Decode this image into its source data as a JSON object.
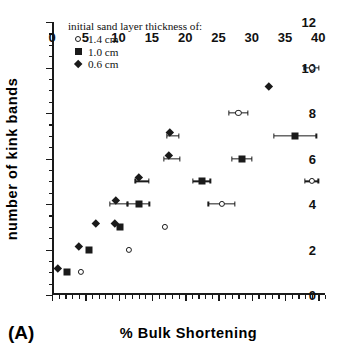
{
  "panel_label": "(A)",
  "legend": {
    "title": "initial sand layer thickness of:",
    "entries": [
      {
        "label": "1.4 cm",
        "marker": "open-circle"
      },
      {
        "label": "1.0 cm",
        "marker": "filled-square"
      },
      {
        "label": "0.6 cm",
        "marker": "filled-diamond"
      }
    ]
  },
  "chart_data": {
    "type": "scatter",
    "title": "",
    "xlabel": "%  Bulk  Shortening",
    "ylabel": "number  of  kink  bands",
    "xlim": [
      0,
      41
    ],
    "ylim": [
      0,
      12
    ],
    "xticks": [
      0,
      5,
      10,
      15,
      20,
      25,
      30,
      35,
      40
    ],
    "yticks": [
      0,
      2,
      4,
      6,
      8,
      10,
      12
    ],
    "xtick_labels": [
      "0",
      "5",
      "10",
      "15",
      "20",
      "25",
      "30",
      "35",
      "40"
    ],
    "ytick_labels": [
      "0",
      "2",
      "4",
      "6",
      "8",
      "10",
      "12"
    ],
    "x_minor_step": 1,
    "y_minor_step": 0.5,
    "grid": false,
    "legend_position": "top-left-inside",
    "series": [
      {
        "name": "1.4 cm",
        "marker": "open-circle",
        "points": [
          {
            "x": 4.3,
            "y": 1,
            "xerr": 0
          },
          {
            "x": 11.5,
            "y": 2,
            "xerr": 0
          },
          {
            "x": 17.0,
            "y": 3,
            "xerr": 0
          },
          {
            "x": 25.5,
            "y": 4,
            "xerr": 2.0
          },
          {
            "x": 39.0,
            "y": 5,
            "xerr": 1.0
          },
          {
            "x": 28.0,
            "y": 8,
            "xerr": 1.4
          },
          {
            "x": 39.0,
            "y": 10,
            "xerr": 1.1
          }
        ]
      },
      {
        "name": "1.0 cm",
        "marker": "filled-square",
        "points": [
          {
            "x": 2.3,
            "y": 1,
            "xerr": 0
          },
          {
            "x": 5.5,
            "y": 2,
            "xerr": 0
          },
          {
            "x": 10.2,
            "y": 3,
            "xerr": 0
          },
          {
            "x": 13.0,
            "y": 4,
            "xerr": 1.6
          },
          {
            "x": 22.5,
            "y": 5,
            "xerr": 1.3
          },
          {
            "x": 28.5,
            "y": 6,
            "xerr": 1.5
          },
          {
            "x": 36.5,
            "y": 7,
            "xerr": 3.2
          }
        ]
      },
      {
        "name": "0.6 cm",
        "marker": "filled-diamond",
        "points": [
          {
            "x": 1.3,
            "y": 1,
            "xerr": 0
          },
          {
            "x": 4.5,
            "y": 2,
            "xerr": 0
          },
          {
            "x": 7.0,
            "y": 3,
            "xerr": 0
          },
          {
            "x": 9.9,
            "y": 3,
            "xerr": 0
          },
          {
            "x": 10.0,
            "y": 4,
            "xerr": 1.3
          },
          {
            "x": 13.5,
            "y": 5,
            "xerr": 1.0
          },
          {
            "x": 18.0,
            "y": 6,
            "xerr": 1.2
          },
          {
            "x": 18.2,
            "y": 7,
            "xerr": 0.9
          },
          {
            "x": 33.0,
            "y": 9,
            "xerr": 0
          }
        ]
      }
    ]
  }
}
